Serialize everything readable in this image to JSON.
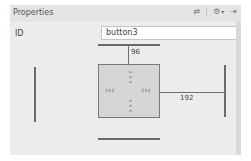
{
  "panel": {
    "title": "Properties",
    "icons": [
      "swap-arrows-icon",
      "gear-icon",
      "chevron-down-icon",
      "pin-icon"
    ]
  },
  "id_field": {
    "label": "ID",
    "value": "button3"
  },
  "constraints": {
    "top_margin": "96",
    "end_margin": "192",
    "top_chevrons": "˅\n˅\n˅",
    "bottom_chevrons": "˄\n˄\n˄",
    "left_chevrons": "›››",
    "right_chevrons": "‹‹‹"
  },
  "colors": {
    "panel_bg": "#ececec",
    "box_bg": "#d6d6d6",
    "line": "#6b6b6b"
  }
}
